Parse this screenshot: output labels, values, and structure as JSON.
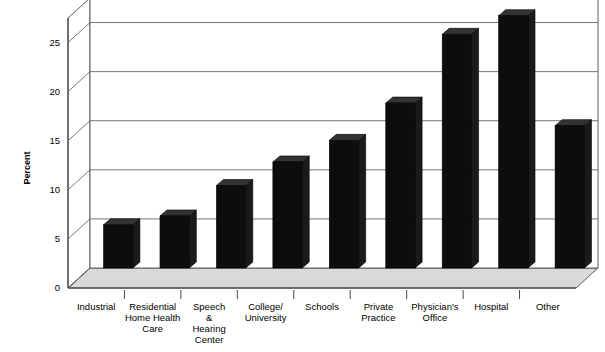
{
  "chart_data": {
    "type": "bar",
    "title": "",
    "subtitle": "",
    "xlabel": "",
    "ylabel": "Percent",
    "ylim": [
      0,
      27.5
    ],
    "yticks": [
      0,
      5,
      10,
      15,
      20,
      25
    ],
    "ytick_labels": [
      "0",
      "5",
      "10",
      "15",
      "20",
      "25"
    ],
    "grid": true,
    "legend": null,
    "style": "3d-perspective-bars",
    "bar_color": "#0d0d0d",
    "floor_color": "#d9d9d9",
    "wall_color": "#ffffff",
    "categories": [
      "Industrial",
      "Residential Home Health Care",
      "Speech & Hearing Center",
      "College/University",
      "Schools",
      "Private Practice",
      "Physician's Office",
      "Hospital",
      "Other"
    ],
    "category_label_lines": [
      [
        "Industrial"
      ],
      [
        "Residential",
        "Home Health",
        "Care"
      ],
      [
        "Speech",
        "&",
        "Hearing",
        "Center"
      ],
      [
        "College/",
        "University"
      ],
      [
        "Schools"
      ],
      [
        "Private",
        "Practice"
      ],
      [
        "Physician's",
        "Office"
      ],
      [
        "Hospital"
      ],
      [
        "Other"
      ]
    ],
    "values": [
      4.4,
      5.3,
      8.4,
      10.8,
      13.0,
      16.8,
      23.8,
      25.7,
      14.5
    ]
  }
}
